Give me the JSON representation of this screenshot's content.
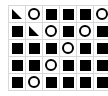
{
  "board": {
    "rows": 5,
    "cols": 6,
    "colors": {
      "piece": "#000000",
      "grid": "#d8d8d8",
      "background": "#ffffff"
    },
    "cells": [
      [
        "triangle",
        "circle",
        "square",
        "square",
        "square",
        "circle"
      ],
      [
        "square",
        "triangle",
        "circle",
        "square",
        "circle",
        "square"
      ],
      [
        "square",
        "square",
        "square",
        "circle",
        "square",
        "square"
      ],
      [
        "square",
        "square",
        "circle",
        "square",
        "square",
        "square"
      ],
      [
        "square",
        "circle",
        "square",
        "square",
        "square",
        "square"
      ]
    ]
  }
}
